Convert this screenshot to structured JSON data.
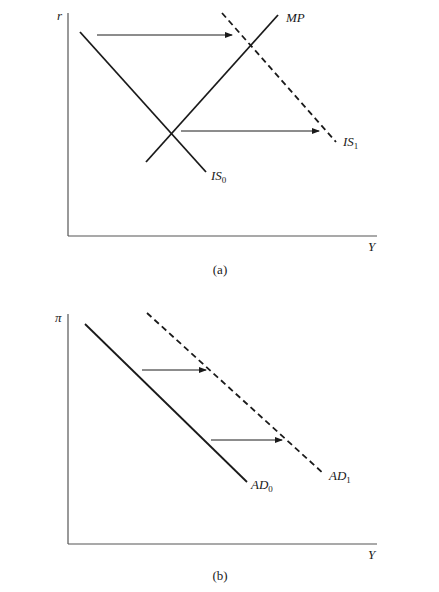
{
  "panel_a": {
    "caption": "(a)",
    "y_axis_label": "r",
    "x_axis_label": "Y",
    "curves": {
      "is0": {
        "label_main": "IS",
        "label_sub": "0",
        "style": "solid"
      },
      "is1": {
        "label_main": "IS",
        "label_sub": "1",
        "style": "dashed"
      },
      "mp": {
        "label_main": "MP",
        "label_sub": "",
        "style": "solid"
      }
    },
    "arrows": [
      {
        "from": "IS0",
        "to": "IS1",
        "direction": "right",
        "position": "upper"
      },
      {
        "from": "IS0",
        "to": "IS1",
        "direction": "right",
        "position": "lower"
      }
    ]
  },
  "panel_b": {
    "caption": "(b)",
    "y_axis_label": "π",
    "x_axis_label": "Y",
    "curves": {
      "ad0": {
        "label_main": "AD",
        "label_sub": "0",
        "style": "solid"
      },
      "ad1": {
        "label_main": "AD",
        "label_sub": "1",
        "style": "dashed"
      }
    },
    "arrows": [
      {
        "from": "AD0",
        "to": "AD1",
        "direction": "right",
        "position": "upper"
      },
      {
        "from": "AD0",
        "to": "AD1",
        "direction": "right",
        "position": "lower"
      }
    ]
  }
}
